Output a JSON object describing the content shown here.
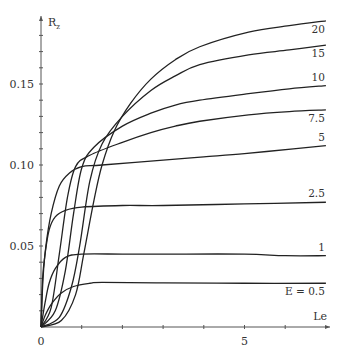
{
  "chart_data": {
    "type": "line",
    "title": "",
    "xlabel": "Le",
    "ylabel": "R_z",
    "ylabel_main": "R",
    "ylabel_sub": "z",
    "xlim": [
      0,
      7
    ],
    "ylim": [
      0,
      0.19
    ],
    "grid": false,
    "legend": "inline-right",
    "x_ticks": [
      0,
      1,
      2,
      3,
      4,
      5,
      6
    ],
    "x_tick_labels": [
      {
        "value": 0,
        "label": "0"
      },
      {
        "value": 5,
        "label": "5"
      }
    ],
    "y_ticks": [
      0.01,
      0.02,
      0.03,
      0.04,
      0.05,
      0.06,
      0.07,
      0.08,
      0.09,
      0.1,
      0.11,
      0.12,
      0.13,
      0.14,
      0.15,
      0.16,
      0.17,
      0.18
    ],
    "y_tick_labels": [
      {
        "value": 0.05,
        "label": "0.05"
      },
      {
        "value": 0.1,
        "label": "0.10"
      },
      {
        "value": 0.15,
        "label": "0.15"
      }
    ],
    "series": [
      {
        "name": "20",
        "label": "20",
        "label_pos": "below",
        "points": [
          [
            0,
            0
          ],
          [
            0.5,
            0.004
          ],
          [
            0.85,
            0.02
          ],
          [
            1.05,
            0.045
          ],
          [
            1.3,
            0.078
          ],
          [
            1.5,
            0.1
          ],
          [
            1.8,
            0.121
          ],
          [
            2.2,
            0.138
          ],
          [
            2.7,
            0.153
          ],
          [
            3.3,
            0.165
          ],
          [
            3.9,
            0.173
          ],
          [
            5.1,
            0.182
          ],
          [
            6.1,
            0.186
          ],
          [
            7.0,
            0.189
          ]
        ]
      },
      {
        "name": "15",
        "label": "15",
        "label_pos": "below",
        "points": [
          [
            0,
            0
          ],
          [
            0.45,
            0.006
          ],
          [
            0.75,
            0.025
          ],
          [
            0.95,
            0.05
          ],
          [
            1.2,
            0.09
          ],
          [
            1.5,
            0.113
          ],
          [
            2.0,
            0.13
          ],
          [
            2.7,
            0.146
          ],
          [
            3.3,
            0.155
          ],
          [
            3.9,
            0.162
          ],
          [
            5.1,
            0.168
          ],
          [
            6.1,
            0.171
          ],
          [
            7.0,
            0.174
          ]
        ]
      },
      {
        "name": "10",
        "label": "10",
        "label_pos": "above",
        "points": [
          [
            0,
            0
          ],
          [
            0.35,
            0.01
          ],
          [
            0.6,
            0.035
          ],
          [
            0.8,
            0.07
          ],
          [
            1.0,
            0.098
          ],
          [
            1.3,
            0.111
          ],
          [
            2.0,
            0.124
          ],
          [
            2.7,
            0.132
          ],
          [
            3.3,
            0.137
          ],
          [
            3.9,
            0.14
          ],
          [
            5.1,
            0.144
          ],
          [
            6.1,
            0.147
          ],
          [
            7.0,
            0.149
          ]
        ]
      },
      {
        "name": "7.5",
        "label": "7.5",
        "label_pos": "below",
        "points": [
          [
            0,
            0
          ],
          [
            0.25,
            0.012
          ],
          [
            0.45,
            0.045
          ],
          [
            0.65,
            0.08
          ],
          [
            0.85,
            0.099
          ],
          [
            1.2,
            0.106
          ],
          [
            2.0,
            0.114
          ],
          [
            2.7,
            0.12
          ],
          [
            3.3,
            0.124
          ],
          [
            3.9,
            0.127
          ],
          [
            5.1,
            0.131
          ],
          [
            6.1,
            0.133
          ],
          [
            7.0,
            0.134
          ]
        ]
      },
      {
        "name": "5",
        "label": "5",
        "label_pos": "above",
        "points": [
          [
            0,
            0
          ],
          [
            0.05,
            0.03
          ],
          [
            0.12,
            0.05
          ],
          [
            0.25,
            0.07
          ],
          [
            0.45,
            0.087
          ],
          [
            0.7,
            0.095
          ],
          [
            1.0,
            0.099
          ],
          [
            1.5,
            0.1
          ],
          [
            3.0,
            0.103
          ],
          [
            4.0,
            0.105
          ],
          [
            5.0,
            0.107
          ],
          [
            6.2,
            0.11
          ],
          [
            7.0,
            0.112
          ]
        ]
      },
      {
        "name": "2.5",
        "label": "2.5",
        "label_pos": "above",
        "points": [
          [
            0,
            0
          ],
          [
            0.04,
            0.03
          ],
          [
            0.1,
            0.045
          ],
          [
            0.2,
            0.06
          ],
          [
            0.35,
            0.068
          ],
          [
            0.6,
            0.072
          ],
          [
            1.0,
            0.074
          ],
          [
            2.0,
            0.075
          ],
          [
            3.0,
            0.075
          ],
          [
            5.0,
            0.076
          ],
          [
            7.0,
            0.077
          ]
        ]
      },
      {
        "name": "1",
        "label": "1",
        "label_pos": "above",
        "points": [
          [
            0,
            0
          ],
          [
            0.1,
            0.015
          ],
          [
            0.2,
            0.027
          ],
          [
            0.35,
            0.036
          ],
          [
            0.6,
            0.043
          ],
          [
            1.0,
            0.045
          ],
          [
            2.0,
            0.045
          ],
          [
            3.0,
            0.045
          ],
          [
            5.0,
            0.045
          ],
          [
            6.0,
            0.044
          ],
          [
            7.0,
            0.044
          ]
        ]
      },
      {
        "name": "0.5",
        "label": "E = 0.5",
        "label_pos": "below",
        "points": [
          [
            0,
            0
          ],
          [
            0.1,
            0.007
          ],
          [
            0.25,
            0.014
          ],
          [
            0.5,
            0.021
          ],
          [
            0.8,
            0.025
          ],
          [
            1.2,
            0.027
          ],
          [
            1.5,
            0.0275
          ],
          [
            3.0,
            0.0272
          ],
          [
            5.0,
            0.027
          ],
          [
            7.0,
            0.027
          ]
        ]
      }
    ]
  }
}
